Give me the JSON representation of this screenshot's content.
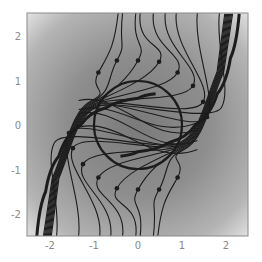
{
  "chart_data": {
    "type": "streamplot",
    "title": "",
    "xlabel": "",
    "ylabel": "",
    "xlim": [
      -2.5,
      2.5
    ],
    "ylim": [
      -2.5,
      2.5
    ],
    "grid": false,
    "legend": null,
    "x_ticks": [
      -2,
      -1,
      0,
      1,
      2
    ],
    "y_ticks": [
      -2,
      -1,
      0,
      1,
      2
    ],
    "x_tick_labels": [
      "-2",
      "-1",
      "0",
      "1",
      "2"
    ],
    "y_tick_labels": [
      "2",
      "1",
      "0",
      "-1",
      "-2"
    ],
    "background": "radial grayscale gradient, darker near center, lighter at corners",
    "circle": {
      "cx": 0,
      "cy": 0,
      "r": 1
    },
    "separatrices": [
      {
        "name": "upper-right",
        "points": [
          [
            2.3,
            2.5
          ],
          [
            2.1,
            1.5
          ],
          [
            1.8,
            0.7
          ],
          [
            1.3,
            0.0
          ],
          [
            0.7,
            -0.4
          ],
          [
            0.0,
            -0.6
          ],
          [
            -0.4,
            -0.7
          ]
        ]
      },
      {
        "name": "lower-left",
        "points": [
          [
            -2.3,
            -2.5
          ],
          [
            -2.1,
            -1.5
          ],
          [
            -1.8,
            -0.7
          ],
          [
            -1.3,
            0.0
          ],
          [
            -0.7,
            0.4
          ],
          [
            0.0,
            0.6
          ],
          [
            0.4,
            0.7
          ]
        ]
      }
    ],
    "streamlines_top": [
      {
        "start_x": -0.45,
        "dot": [
          -0.9,
          1.18
        ]
      },
      {
        "start_x": -0.35,
        "dot": [
          -0.48,
          1.45
        ]
      },
      {
        "start_x": -0.05,
        "dot": [
          0.0,
          1.45
        ]
      },
      {
        "start_x": 0.05,
        "dot": [
          0.48,
          1.42
        ]
      },
      {
        "start_x": 0.35,
        "dot": [
          0.9,
          1.18
        ]
      },
      {
        "start_x": 0.62,
        "dot": [
          1.25,
          0.88
        ]
      },
      {
        "start_x": 0.87,
        "dot": [
          1.48,
          0.52
        ]
      },
      {
        "start_x": 1.35,
        "dot": [
          1.57,
          0.18
        ]
      },
      {
        "start_x": 1.85,
        "dot": null
      }
    ],
    "streamlines_bottom": [
      {
        "start_x": 0.45,
        "dot": [
          0.9,
          -1.18
        ]
      },
      {
        "start_x": 0.35,
        "dot": [
          0.48,
          -1.45
        ]
      },
      {
        "start_x": 0.05,
        "dot": [
          0.0,
          -1.45
        ]
      },
      {
        "start_x": -0.05,
        "dot": [
          -0.48,
          -1.42
        ]
      },
      {
        "start_x": -0.35,
        "dot": [
          -0.9,
          -1.18
        ]
      },
      {
        "start_x": -0.62,
        "dot": [
          -1.25,
          -0.88
        ]
      },
      {
        "start_x": -0.87,
        "dot": [
          -1.48,
          -0.52
        ]
      },
      {
        "start_x": -1.35,
        "dot": [
          -1.57,
          -0.18
        ]
      },
      {
        "start_x": -1.85,
        "dot": null
      }
    ],
    "inner_streamlines": [
      {
        "y_left": 0.55,
        "y_right": -0.1
      },
      {
        "y_left": 0.25,
        "y_right": -0.35
      },
      {
        "y_left": -0.05,
        "y_right": -0.55
      },
      {
        "y_left": 0.35,
        "y_right": 0.05
      }
    ]
  }
}
